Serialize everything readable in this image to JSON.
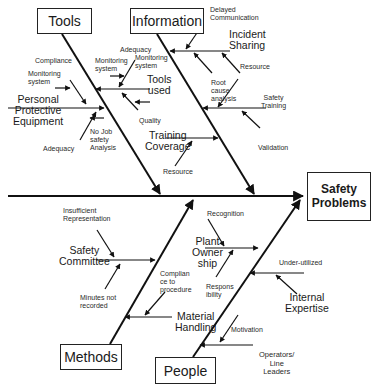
{
  "diagram": {
    "type": "fishbone",
    "effect": "Safety\nProblems",
    "line_color": "#111111",
    "categories": {
      "tools": {
        "label": "Tools",
        "causes": {
          "ppe": "Personal\nProtective\nEquipment",
          "tools_used": "Tools\nused",
          "compliance": "Compliance",
          "monitoring_system_1": "Monitoring\nsystem",
          "monitoring_system_2": "Monitoring\nsystem",
          "monitoring_system_3": "Monitoring\nsystem",
          "adequacy_top": "Adequacy",
          "adequacy_bottom": "Adequacy",
          "no_job_safety": "No Job\nsafety\nAnalysis",
          "quality": "Quality"
        }
      },
      "information": {
        "label": "Information",
        "causes": {
          "delayed_communication": "Delayed\nCommunication",
          "incident_sharing": "Incident\nSharing",
          "resource_1": "Resource",
          "root_cause": "Root\ncause\nanalysis",
          "safety_training": "Safety\nTraining",
          "validation": "Validation",
          "training_coverage": "Training\nCoverage",
          "resource_2": "Resource"
        }
      },
      "methods": {
        "label": "Methods",
        "causes": {
          "insufficient_representation": "Insufficient\nRepresentation",
          "safety_committee": "Safety\nCommittee",
          "minutes_not_recorded": "Minutes not\nrecorded",
          "compliance_procedure": "Complian\nce to\nprocedure",
          "material_handling": "Material\nHandling"
        }
      },
      "people": {
        "label": "People",
        "causes": {
          "recognition": "Recognition",
          "plant_ownership": "Plant\nOwner\nship",
          "responsibility": "Respons\nibility",
          "under_utilized": "Under-utilized",
          "internal_expertise": "Internal\nExpertise",
          "motivation": "Motivation",
          "operators_line_leaders": "Operators/\nLine\nLeaders"
        }
      }
    }
  }
}
